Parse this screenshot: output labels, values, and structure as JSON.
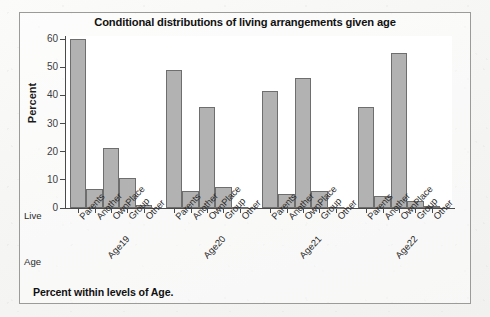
{
  "chart_data": {
    "type": "bar",
    "title": "Conditional distributions of living arrangements given age",
    "footer": "Percent within levels of Age.",
    "xlabel": "",
    "ylabel": "Percent",
    "ylim": [
      0,
      60
    ],
    "yticks": [
      0,
      10,
      20,
      30,
      40,
      50,
      60
    ],
    "grid": false,
    "legend": false,
    "row_header_categories": "Live",
    "row_header_groups": "Age",
    "categories": [
      "Parents",
      "Another",
      "OwnPlace",
      "Group",
      "Other"
    ],
    "groups": [
      "Age19",
      "Age20",
      "Age21",
      "Age22"
    ],
    "series": [
      {
        "name": "Age19",
        "values": [
          60.0,
          6.9,
          21.4,
          10.8,
          0.9
        ]
      },
      {
        "name": "Age20",
        "values": [
          49.1,
          6.1,
          35.9,
          7.6,
          0.3
        ]
      },
      {
        "name": "Age21",
        "values": [
          41.5,
          4.9,
          46.0,
          5.9,
          0.4
        ]
      },
      {
        "name": "Age22",
        "values": [
          35.8,
          4.1,
          55.2,
          2.5,
          0.7
        ]
      }
    ],
    "colors": {
      "bar_fill": "#b2b2b2",
      "bar_border": "#6e6e6e",
      "axis": "#4a4a4a",
      "panel": "#ffffff",
      "page": "#f4f4f3",
      "frame": "#9b9b99",
      "text": "#111111"
    }
  }
}
